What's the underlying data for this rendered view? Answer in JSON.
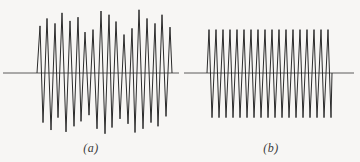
{
  "figure": {
    "background_color": "#f7f6f4",
    "ink_color": "#2b2b2b",
    "baseline_color": "#4a4a4a"
  },
  "panels": [
    {
      "id": "a",
      "caption": "(a)",
      "description": "irregular amplitude oscillogram trace",
      "baseline_label": "zero axis"
    },
    {
      "id": "b",
      "caption": "(b)",
      "description": "uniform amplitude oscillogram trace",
      "baseline_label": "zero axis"
    }
  ],
  "chart_data": [
    {
      "type": "line",
      "title": "(a)",
      "xlabel": "",
      "ylabel": "",
      "xlim": [
        0,
        182
      ],
      "ylim": [
        -1.15,
        1.15
      ],
      "grid": false,
      "legend": "none",
      "baseline_y": 0,
      "baseline_x_range": [
        3,
        179
      ],
      "series": [
        {
          "name": "trace-a",
          "comment": "peak (+) and trough (-) amplitudes per half cycle, in normalized units; x positions in px",
          "x_start": 37,
          "x_end": 172,
          "peaks_x": [
            40,
            47,
            55,
            62,
            70,
            78,
            85,
            93,
            101,
            109,
            116,
            124,
            132,
            139,
            147,
            155,
            162,
            170
          ],
          "peaks_y": [
            0.76,
            0.88,
            0.8,
            0.97,
            0.84,
            0.9,
            0.66,
            0.7,
            1.0,
            0.94,
            0.83,
            0.62,
            0.72,
            1.02,
            0.88,
            0.8,
            0.94,
            0.74
          ],
          "troughs_x": [
            43,
            51,
            58,
            66,
            74,
            81,
            89,
            97,
            105,
            112,
            120,
            128,
            135,
            143,
            151,
            158,
            166
          ],
          "troughs_y": [
            -0.8,
            -0.92,
            -0.72,
            -0.95,
            -0.86,
            -0.78,
            -0.68,
            -0.9,
            -0.98,
            -0.88,
            -0.74,
            -0.82,
            -0.96,
            -0.9,
            -0.8,
            -0.86,
            -0.7
          ]
        }
      ]
    },
    {
      "type": "line",
      "title": "(b)",
      "xlabel": "",
      "ylabel": "",
      "xlim": [
        0,
        178
      ],
      "ylim": [
        -1.15,
        1.15
      ],
      "grid": false,
      "legend": "none",
      "baseline_y": 0,
      "baseline_x_range": [
        2,
        172
      ],
      "series": [
        {
          "name": "trace-b",
          "comment": "constant amplitude oscillation, nearly uniform period",
          "x_start": 25,
          "x_end": 150,
          "peaks_x": [
            27,
            34,
            41,
            48,
            55,
            62,
            69,
            76,
            83,
            90,
            97,
            104,
            111,
            118,
            125,
            132,
            139,
            146
          ],
          "peaks_y": [
            0.7,
            0.7,
            0.7,
            0.7,
            0.7,
            0.7,
            0.7,
            0.7,
            0.7,
            0.7,
            0.7,
            0.7,
            0.7,
            0.7,
            0.7,
            0.7,
            0.7,
            0.7
          ],
          "troughs_x": [
            30,
            37,
            44,
            51,
            58,
            65,
            72,
            79,
            86,
            93,
            100,
            107,
            114,
            121,
            128,
            135,
            142,
            149
          ],
          "troughs_y": [
            -0.72,
            -0.72,
            -0.72,
            -0.72,
            -0.72,
            -0.72,
            -0.72,
            -0.72,
            -0.72,
            -0.72,
            -0.72,
            -0.72,
            -0.72,
            -0.72,
            -0.72,
            -0.72,
            -0.72,
            -0.72
          ]
        }
      ]
    }
  ]
}
